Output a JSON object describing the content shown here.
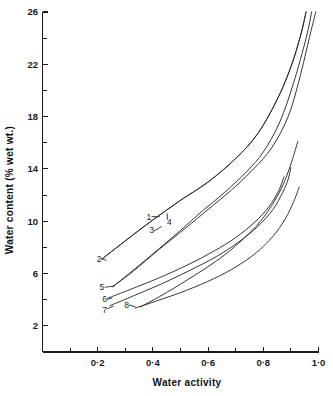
{
  "chart_data": {
    "type": "line",
    "title": "",
    "xlabel": "Water activity",
    "ylabel": "Water content (% wet wt.)",
    "xlim": [
      0.0,
      1.0
    ],
    "ylim": [
      0,
      26
    ],
    "grid": false,
    "legend_position": "inline-curve-labels",
    "x_ticks_major": [
      "0·2",
      "0·4",
      "0·6",
      "0·8",
      "1·0"
    ],
    "x_tick_values": [
      0.2,
      0.4,
      0.6,
      0.8,
      1.0
    ],
    "x_minor_tick_values": [
      0.1,
      0.3,
      0.5,
      0.7,
      0.9
    ],
    "y_ticks_major": [
      "2",
      "6",
      "10",
      "14",
      "18",
      "22",
      "26"
    ],
    "y_tick_values": [
      2,
      6,
      10,
      14,
      18,
      22,
      26
    ],
    "y_minor_tick_values": [
      4,
      8,
      12,
      16,
      20,
      24
    ],
    "series": [
      {
        "name": "1",
        "label": "1",
        "label_x": 0.385,
        "label_y": 10.35,
        "points": [
          [
            0.215,
            7.1
          ],
          [
            0.3,
            8.5
          ],
          [
            0.4,
            10.1
          ],
          [
            0.5,
            11.6
          ],
          [
            0.6,
            13.0
          ],
          [
            0.7,
            14.8
          ],
          [
            0.78,
            16.7
          ],
          [
            0.85,
            19.3
          ],
          [
            0.9,
            21.8
          ],
          [
            0.935,
            24.2
          ],
          [
            0.955,
            26.0
          ]
        ]
      },
      {
        "name": "2",
        "label": "2",
        "label_x": 0.205,
        "label_y": 7.15,
        "points": [
          [
            0.215,
            7.1
          ],
          [
            0.3,
            8.5
          ],
          [
            0.4,
            10.1
          ],
          [
            0.5,
            11.6
          ],
          [
            0.6,
            13.0
          ],
          [
            0.7,
            14.8
          ],
          [
            0.78,
            16.7
          ],
          [
            0.85,
            19.3
          ],
          [
            0.9,
            21.8
          ],
          [
            0.935,
            24.2
          ],
          [
            0.955,
            26.0
          ]
        ]
      },
      {
        "name": "3",
        "label": "3",
        "label_x": 0.395,
        "label_y": 9.3,
        "points": [
          [
            0.255,
            5.0
          ],
          [
            0.32,
            6.1
          ],
          [
            0.4,
            7.5
          ],
          [
            0.5,
            9.3
          ],
          [
            0.58,
            10.8
          ],
          [
            0.66,
            12.2
          ],
          [
            0.74,
            13.8
          ],
          [
            0.8,
            15.3
          ],
          [
            0.86,
            17.6
          ],
          [
            0.91,
            20.6
          ],
          [
            0.955,
            24.0
          ],
          [
            0.975,
            26.0
          ]
        ]
      },
      {
        "name": "4",
        "label": "4",
        "label_x": 0.46,
        "label_y": 9.95,
        "points": [
          [
            0.255,
            5.0
          ],
          [
            0.33,
            6.2
          ],
          [
            0.42,
            7.8
          ],
          [
            0.52,
            9.5
          ],
          [
            0.6,
            10.9
          ],
          [
            0.68,
            12.3
          ],
          [
            0.76,
            13.9
          ],
          [
            0.83,
            15.6
          ],
          [
            0.89,
            18.0
          ],
          [
            0.93,
            20.8
          ],
          [
            0.97,
            24.3
          ],
          [
            0.99,
            26.0
          ]
        ]
      },
      {
        "name": "5",
        "label": "5",
        "label_x": 0.215,
        "label_y": 4.95,
        "points": [
          [
            0.355,
            3.45
          ],
          [
            0.45,
            4.55
          ],
          [
            0.55,
            5.85
          ],
          [
            0.64,
            7.1
          ],
          [
            0.72,
            8.5
          ],
          [
            0.79,
            10.0
          ],
          [
            0.845,
            11.7
          ],
          [
            0.88,
            13.2
          ],
          [
            0.905,
            14.7
          ],
          [
            0.925,
            16.1
          ]
        ]
      },
      {
        "name": "6",
        "label": "6",
        "label_x": 0.225,
        "label_y": 4.02,
        "points": [
          [
            0.235,
            4.1
          ],
          [
            0.32,
            4.8
          ],
          [
            0.42,
            5.65
          ],
          [
            0.52,
            6.6
          ],
          [
            0.62,
            7.7
          ],
          [
            0.7,
            8.75
          ],
          [
            0.77,
            9.95
          ],
          [
            0.82,
            11.1
          ],
          [
            0.855,
            12.3
          ],
          [
            0.875,
            13.4
          ]
        ]
      },
      {
        "name": "7",
        "label": "7",
        "label_x": 0.225,
        "label_y": 3.25,
        "points": [
          [
            0.245,
            3.55
          ],
          [
            0.33,
            4.3
          ],
          [
            0.43,
            5.2
          ],
          [
            0.53,
            6.2
          ],
          [
            0.63,
            7.3
          ],
          [
            0.71,
            8.4
          ],
          [
            0.78,
            9.6
          ],
          [
            0.835,
            10.9
          ],
          [
            0.87,
            12.2
          ],
          [
            0.89,
            13.2
          ],
          [
            0.9,
            14.1
          ]
        ]
      },
      {
        "name": "8",
        "label": "8",
        "label_x": 0.305,
        "label_y": 3.62,
        "points": [
          [
            0.335,
            3.35
          ],
          [
            0.42,
            3.95
          ],
          [
            0.52,
            4.7
          ],
          [
            0.62,
            5.6
          ],
          [
            0.7,
            6.5
          ],
          [
            0.775,
            7.6
          ],
          [
            0.835,
            8.85
          ],
          [
            0.88,
            10.2
          ],
          [
            0.91,
            11.5
          ],
          [
            0.93,
            12.6
          ]
        ]
      }
    ],
    "leaders": [
      {
        "name": "1",
        "from_x": 0.395,
        "from_y": 10.35,
        "to_x": 0.425,
        "to_y": 10.35
      },
      {
        "name": "2",
        "from_x": 0.213,
        "from_y": 7.15,
        "to_x": 0.232,
        "to_y": 7.0
      },
      {
        "name": "3",
        "from_x": 0.404,
        "from_y": 9.25,
        "to_x": 0.432,
        "to_y": 9.6
      },
      {
        "name": "4",
        "from_x": 0.452,
        "from_y": 10.1,
        "to_x": 0.452,
        "to_y": 10.6
      },
      {
        "name": "5",
        "from_x": 0.225,
        "from_y": 4.95,
        "to_x": 0.262,
        "to_y": 5.05
      },
      {
        "name": "6",
        "from_x": 0.234,
        "from_y": 4.03,
        "to_x": 0.252,
        "to_y": 4.12
      },
      {
        "name": "7",
        "from_x": 0.234,
        "from_y": 3.3,
        "to_x": 0.258,
        "to_y": 3.52
      },
      {
        "name": "8",
        "from_x": 0.313,
        "from_y": 3.6,
        "to_x": 0.337,
        "to_y": 3.45
      }
    ]
  }
}
